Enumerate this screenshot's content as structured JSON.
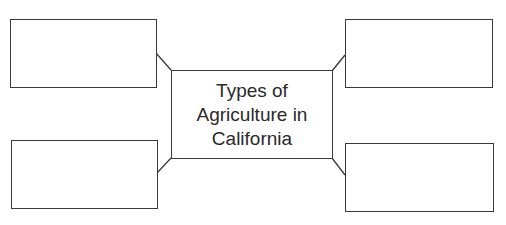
{
  "diagram": {
    "type": "concept-map",
    "center": {
      "label": "Types of\nAgriculture in\nCalifornia"
    },
    "branches": [
      {
        "position": "top-left",
        "label": ""
      },
      {
        "position": "bottom-left",
        "label": ""
      },
      {
        "position": "top-right",
        "label": ""
      },
      {
        "position": "bottom-right",
        "label": ""
      }
    ],
    "colors": {
      "stroke": "#3a3a3a",
      "background": "#ffffff",
      "text": "#2a2a2a"
    }
  }
}
